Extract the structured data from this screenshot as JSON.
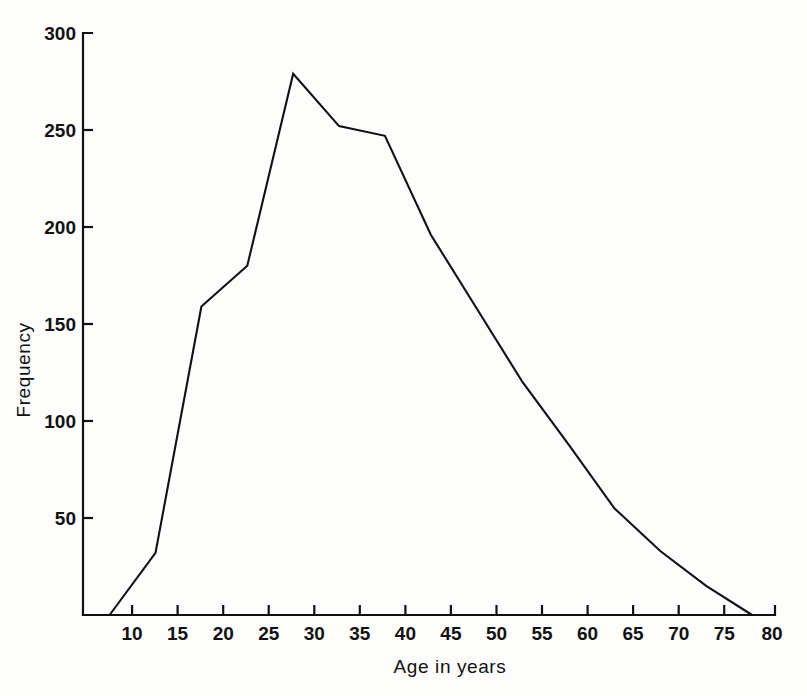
{
  "chart_data": {
    "type": "line",
    "title": "",
    "subtitle": "",
    "xlabel": "Age in years",
    "ylabel": "Frequency",
    "xlim": [
      4.6,
      80
    ],
    "ylim": [
      0,
      300
    ],
    "grid": false,
    "legend": null,
    "x_ticks": [
      10,
      15,
      20,
      25,
      30,
      35,
      40,
      45,
      50,
      55,
      60,
      65,
      70,
      75,
      80
    ],
    "x_tick_labels": [
      "10",
      "15",
      "20",
      "25",
      "30",
      "35",
      "40",
      "45",
      "50",
      "55",
      "60",
      "65",
      "70",
      "75",
      "80"
    ],
    "y_ticks": [
      50,
      100,
      150,
      200,
      250,
      300
    ],
    "y_tick_labels": [
      "50",
      "100",
      "150",
      "200",
      "250",
      "300"
    ],
    "x": [
      7.5,
      12.5,
      17.5,
      22.5,
      27.5,
      32.5,
      37.5,
      42.5,
      47.5,
      52.5,
      57.5,
      62.5,
      67.5,
      72.5,
      77.5
    ],
    "values": [
      0,
      32,
      159,
      180,
      279,
      252,
      247,
      196,
      158,
      120,
      88,
      55,
      33,
      15,
      0
    ],
    "series": [
      {
        "name": "Frequency polygon",
        "color": "#111111",
        "values": [
          0,
          32,
          159,
          180,
          279,
          252,
          247,
          196,
          158,
          120,
          88,
          55,
          33,
          15,
          0
        ]
      }
    ],
    "annotations": []
  },
  "figure": {
    "background_color": "#fdfdfc",
    "line_color": "#111111",
    "axis_color": "#111111"
  }
}
